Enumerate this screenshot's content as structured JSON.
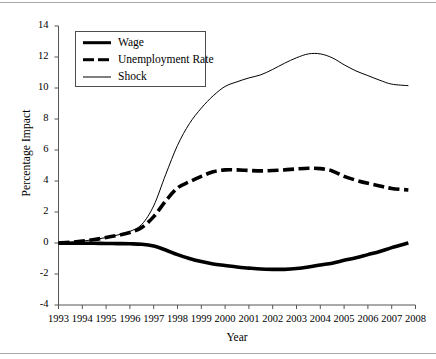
{
  "chart_data": {
    "type": "line",
    "title": "",
    "xlabel": "Year",
    "ylabel": "Percentage Impact",
    "xlim": [
      1993,
      2008
    ],
    "ylim": [
      -4,
      14
    ],
    "grid": false,
    "legend_position": "upper-left",
    "xticks": [
      "1993",
      "1994",
      "1995",
      "1996",
      "1997",
      "1998",
      "1999",
      "2000",
      "2001",
      "2002",
      "2003",
      "2004",
      "2005",
      "2006",
      "2007",
      "2008"
    ],
    "yticks": [
      "14",
      "12",
      "10",
      "8",
      "6",
      "4",
      "2",
      "0",
      "-2",
      "-4"
    ],
    "x": [
      1993,
      1993.5,
      1994,
      1994.5,
      1995,
      1995.5,
      1996,
      1996.5,
      1997,
      1997.5,
      1998,
      1998.5,
      1999,
      1999.5,
      2000,
      2000.5,
      2001,
      2001.5,
      2002,
      2002.5,
      2003,
      2003.5,
      2004,
      2004.5,
      2005,
      2005.5,
      2006,
      2006.5,
      2007,
      2007.7
    ],
    "series": [
      {
        "name": "Wage",
        "style": "solid-thick",
        "color": "#000000",
        "values": [
          -0.02,
          -0.02,
          -0.02,
          -0.02,
          -0.03,
          -0.04,
          -0.05,
          -0.08,
          -0.2,
          -0.45,
          -0.75,
          -1.0,
          -1.2,
          -1.35,
          -1.45,
          -1.55,
          -1.62,
          -1.68,
          -1.7,
          -1.7,
          -1.65,
          -1.55,
          -1.42,
          -1.3,
          -1.12,
          -0.95,
          -0.75,
          -0.55,
          -0.3,
          0.0
        ]
      },
      {
        "name": "Unemployment Rate",
        "style": "dashed-thick",
        "color": "#000000",
        "values": [
          0.0,
          0.05,
          0.12,
          0.22,
          0.35,
          0.5,
          0.68,
          1.0,
          1.7,
          2.7,
          3.55,
          3.95,
          4.3,
          4.6,
          4.72,
          4.72,
          4.68,
          4.65,
          4.68,
          4.72,
          4.78,
          4.82,
          4.8,
          4.65,
          4.3,
          4.05,
          3.85,
          3.68,
          3.52,
          3.42
        ]
      },
      {
        "name": "Shock",
        "style": "solid-thin",
        "color": "#000000",
        "values": [
          0.0,
          0.05,
          0.12,
          0.22,
          0.35,
          0.52,
          0.75,
          1.2,
          2.4,
          4.4,
          6.3,
          7.7,
          8.7,
          9.5,
          10.1,
          10.4,
          10.65,
          10.85,
          11.2,
          11.6,
          11.95,
          12.2,
          12.2,
          11.95,
          11.5,
          11.1,
          10.8,
          10.5,
          10.25,
          10.15
        ]
      }
    ]
  },
  "legend": {
    "items": [
      {
        "label": "Wage"
      },
      {
        "label": "Unemployment Rate"
      },
      {
        "label": "Shock"
      }
    ]
  }
}
